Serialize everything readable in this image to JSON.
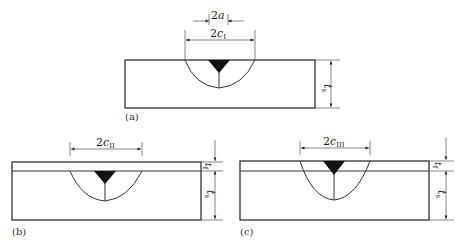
{
  "figure": {
    "panels": [
      {
        "id": "a",
        "label": "(a)",
        "description": "Bare substrate with weld",
        "dimensions": {
          "inner_width": {
            "text": "2",
            "var": "a"
          },
          "outer_width": {
            "text": "2",
            "var": "c",
            "sub": "I"
          },
          "thickness_substrate": {
            "var": "t",
            "sub": "s"
          }
        }
      },
      {
        "id": "b",
        "label": "(b)",
        "description": "Substrate with film; weld under film",
        "dimensions": {
          "outer_width": {
            "text": "2",
            "var": "c",
            "sub": "II"
          },
          "thickness_film": {
            "var": "t",
            "sub": "f"
          },
          "thickness_substrate": {
            "var": "t",
            "sub": "s"
          }
        }
      },
      {
        "id": "c",
        "label": "(c)",
        "description": "Substrate with film; weld through film",
        "dimensions": {
          "outer_width": {
            "text": "2",
            "var": "c",
            "sub": "III"
          },
          "thickness_film": {
            "var": "t",
            "sub": "f"
          },
          "thickness_substrate": {
            "var": "t",
            "sub": "s"
          }
        }
      }
    ],
    "colors": {
      "stroke": "#333333",
      "weld_fill": "#111111",
      "background": "#ffffff"
    }
  }
}
